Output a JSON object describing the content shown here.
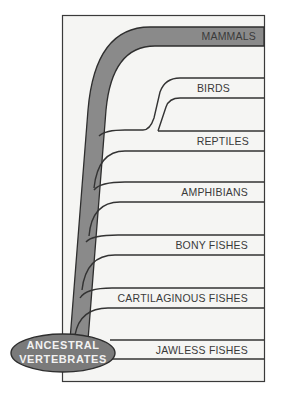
{
  "diagram": {
    "root": {
      "label_line1": "ANCESTRAL",
      "label_line2": "VERTEBRATES"
    },
    "highlighted_lineage": "MAMMALS",
    "groups": [
      {
        "label": "MAMMALS"
      },
      {
        "label": "BIRDS"
      },
      {
        "label": "REPTILES"
      },
      {
        "label": "AMPHIBIANS"
      },
      {
        "label": "BONY FISHES"
      },
      {
        "label": "CARTILAGINOUS FISHES"
      },
      {
        "label": "JAWLESS FISHES"
      }
    ],
    "colors": {
      "background": "#f5f5f3",
      "frame": "#3a3a3a",
      "highlight": "#8a8a8a",
      "root_fill": "#7a7a7a",
      "text": "#3a3a3a"
    }
  }
}
